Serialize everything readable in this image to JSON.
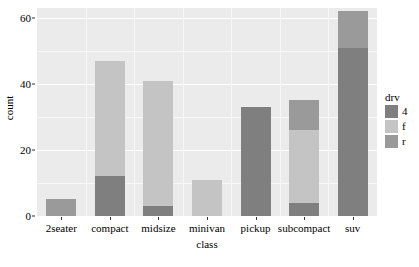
{
  "chart_data": {
    "type": "bar",
    "title": "",
    "subtitle": "",
    "xlabel": "class",
    "ylabel": "count",
    "categories": [
      "2seater",
      "compact",
      "midsize",
      "minivan",
      "pickup",
      "subcompact",
      "suv"
    ],
    "series": [
      {
        "name": "4",
        "color": "#7f7f7f",
        "values": [
          0,
          12,
          3,
          0,
          33,
          4,
          51
        ]
      },
      {
        "name": "f",
        "color": "#c4c4c4",
        "values": [
          0,
          35,
          38,
          11,
          0,
          22,
          0
        ]
      },
      {
        "name": "r",
        "color": "#9a9a9a",
        "values": [
          5,
          0,
          0,
          0,
          0,
          9,
          11
        ]
      }
    ],
    "totals": [
      5,
      47,
      41,
      11,
      33,
      35,
      62
    ],
    "stacked": true,
    "stack_order_bottom_to_top": [
      "4",
      "f",
      "r"
    ],
    "ylim": [
      0,
      63
    ],
    "yticks": [
      0,
      20,
      40,
      60
    ],
    "ytick_labels": [
      "0",
      "20",
      "40",
      "60"
    ],
    "yminor_ticks": [
      10,
      30,
      50
    ],
    "grid": true,
    "legend": {
      "title": "drv",
      "position": "right",
      "entries": [
        {
          "label": "4",
          "color": "#7f7f7f"
        },
        {
          "label": "f",
          "color": "#c4c4c4"
        },
        {
          "label": "r",
          "color": "#9a9a9a"
        }
      ]
    },
    "panel_background": "#ebebeb",
    "grid_color": "#ffffff",
    "plot_background": "#ffffff"
  }
}
